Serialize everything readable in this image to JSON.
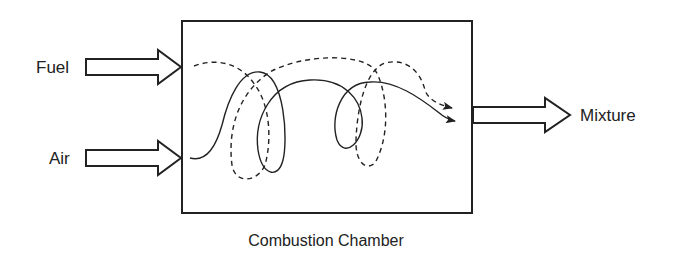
{
  "diagram": {
    "inputs": [
      {
        "label": "Fuel"
      },
      {
        "label": "Air"
      }
    ],
    "output": {
      "label": "Mixture"
    },
    "chamber": {
      "label": "Combustion Chamber"
    },
    "colors": {
      "stroke": "#222222",
      "background": "#ffffff"
    }
  }
}
